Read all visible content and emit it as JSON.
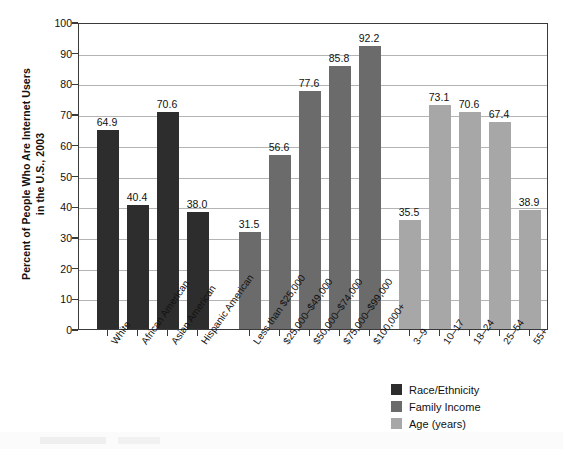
{
  "chart_data": {
    "type": "bar",
    "title": "",
    "xlabel": "",
    "ylabel": "Percent of People Who Are Internet Users\nin the U.S., 2003",
    "ylim": [
      0,
      100
    ],
    "yticks": [
      0,
      10,
      20,
      30,
      40,
      50,
      60,
      70,
      80,
      90,
      100
    ],
    "ytick_labels": [
      "0",
      "10",
      "20",
      "30",
      "40",
      "50",
      "60",
      "70",
      "80",
      "90",
      "100"
    ],
    "grid": true,
    "legend_position": "bottom-right",
    "series": [
      {
        "name": "Race/Ethnicity",
        "color": "#2d2d2d",
        "categories": [
          "White",
          "African American",
          "Asian American",
          "Hispanic American"
        ],
        "values": [
          64.9,
          40.4,
          70.6,
          38.0
        ],
        "value_labels": [
          "64.9",
          "40.4",
          "70.6",
          "38.0"
        ]
      },
      {
        "name": "Family Income",
        "color": "#6b6b6b",
        "categories": [
          "Less than $25,000",
          "$25,000–$49,000",
          "$50,000–$74,000",
          "$75,000–$99,000",
          "$100,000+"
        ],
        "values": [
          31.5,
          56.6,
          77.6,
          85.8,
          92.2
        ],
        "value_labels": [
          "31.5",
          "56.6",
          "77.6",
          "85.8",
          "92.2"
        ]
      },
      {
        "name": "Age (years)",
        "color": "#a7a7a7",
        "categories": [
          "3–9",
          "10–17",
          "18–24",
          "25–54",
          "55+"
        ],
        "values": [
          35.5,
          73.1,
          70.6,
          67.4,
          38.9
        ],
        "value_labels": [
          "35.5",
          "73.1",
          "70.6",
          "67.4",
          "38.9"
        ]
      }
    ],
    "legend": [
      {
        "label": "Race/Ethnicity",
        "color": "#2d2d2d"
      },
      {
        "label": "Family Income",
        "color": "#6b6b6b"
      },
      {
        "label": "Age (years)",
        "color": "#a7a7a7"
      }
    ]
  }
}
